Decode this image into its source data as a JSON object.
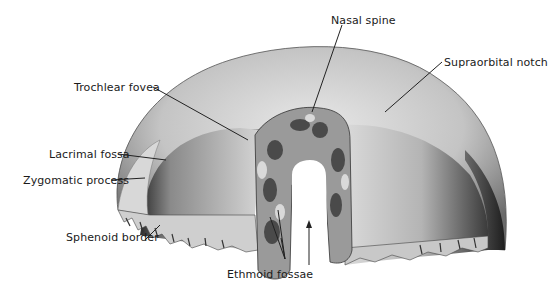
{
  "figure": {
    "colors": {
      "background": "#ffffff",
      "bone_light": "#e4e4e4",
      "bone_mid": "#a8a8a8",
      "bone_dark": "#3a3a3a",
      "leader": "#222222"
    }
  },
  "labels": [
    {
      "id": "nasal-spine",
      "text": "Nasal spine"
    },
    {
      "id": "supraorbital-notch",
      "text": "Supraorbital notch"
    },
    {
      "id": "trochlear-fovea",
      "text": "Trochlear fovea"
    },
    {
      "id": "lacrimal-fossa",
      "text": "Lacrimal fossa"
    },
    {
      "id": "zygomatic-process",
      "text": "Zygomatic process"
    },
    {
      "id": "sphenoid-border",
      "text": "Sphenoid border"
    },
    {
      "id": "ethmoid-fossae",
      "text": "Ethmoid fossae"
    }
  ]
}
